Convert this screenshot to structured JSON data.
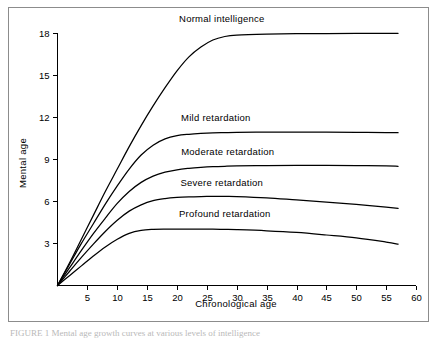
{
  "figure": {
    "background_color": "#ffffff",
    "frame_color": "#8c8c8c",
    "line_color": "#000000",
    "caption": "FIGURE 1   Mental age growth curves at various levels of intelligence"
  },
  "chart_data": {
    "type": "line",
    "title": "",
    "subtitle": "",
    "xlabel": "Chronological age",
    "ylabel": "Mental age",
    "xlim": [
      0,
      60
    ],
    "ylim": [
      0,
      18
    ],
    "xticks": [
      5,
      10,
      15,
      20,
      25,
      30,
      35,
      40,
      45,
      50,
      55,
      60
    ],
    "yticks": [
      3,
      6,
      9,
      12,
      15,
      18
    ],
    "xtick_labels": [
      "5",
      "10",
      "15",
      "20",
      "25",
      "30",
      "35",
      "40",
      "45",
      "50",
      "55",
      "60"
    ],
    "ytick_labels": [
      "3",
      "6",
      "9",
      "12",
      "15",
      "18"
    ],
    "grid": false,
    "legend_position": "inline-labels",
    "x": [
      0,
      2,
      4,
      6,
      8,
      10,
      12,
      14,
      16,
      18,
      20,
      22,
      24,
      26,
      28,
      30,
      35,
      40,
      45,
      50,
      55,
      57
    ],
    "series": [
      {
        "name": "Normal intelligence",
        "label": "Normal intelligence",
        "plateau": 18,
        "values": [
          0,
          1.6,
          3.3,
          5.0,
          6.7,
          8.3,
          9.9,
          11.4,
          12.8,
          14.1,
          15.3,
          16.3,
          17.0,
          17.5,
          17.75,
          17.85,
          17.92,
          17.95,
          17.96,
          17.97,
          17.98,
          17.98
        ]
      },
      {
        "name": "Mild retardation",
        "label": "Mild retardation",
        "plateau": 11,
        "values": [
          0,
          1.5,
          3.0,
          4.4,
          5.8,
          7.1,
          8.3,
          9.3,
          10.0,
          10.45,
          10.68,
          10.78,
          10.84,
          10.88,
          10.9,
          10.92,
          10.94,
          10.94,
          10.93,
          10.92,
          10.9,
          10.89
        ]
      },
      {
        "name": "Moderate retardation",
        "label": "Moderate retardation",
        "plateau": 8.5,
        "values": [
          0,
          1.25,
          2.5,
          3.7,
          4.8,
          5.85,
          6.7,
          7.35,
          7.8,
          8.08,
          8.25,
          8.35,
          8.42,
          8.47,
          8.5,
          8.52,
          8.55,
          8.56,
          8.56,
          8.55,
          8.52,
          8.5
        ]
      },
      {
        "name": "Severe retardation",
        "label": "Severe retardation",
        "plateau": 6.3,
        "values": [
          0,
          1.0,
          2.0,
          2.95,
          3.85,
          4.65,
          5.3,
          5.75,
          6.05,
          6.2,
          6.28,
          6.32,
          6.34,
          6.35,
          6.35,
          6.34,
          6.25,
          6.1,
          5.95,
          5.78,
          5.58,
          5.5
        ]
      },
      {
        "name": "Profound retardation",
        "label": "Profound retardation",
        "plateau": 4.0,
        "values": [
          0,
          0.7,
          1.4,
          2.1,
          2.75,
          3.3,
          3.72,
          3.93,
          4.0,
          4.02,
          4.02,
          4.02,
          4.02,
          4.02,
          4.0,
          3.98,
          3.9,
          3.78,
          3.6,
          3.4,
          3.1,
          2.95
        ]
      }
    ],
    "annotations": [
      {
        "text": "Normal intelligence",
        "x": 27.5,
        "y": 18.8
      },
      {
        "text": "Mild retardation",
        "x": 26.5,
        "y": 11.75
      },
      {
        "text": "Moderate retardation",
        "x": 28.5,
        "y": 9.3
      },
      {
        "text": "Severe retardation",
        "x": 27.5,
        "y": 7.1
      },
      {
        "text": "Profound retardation",
        "x": 28.0,
        "y": 4.85
      }
    ]
  }
}
